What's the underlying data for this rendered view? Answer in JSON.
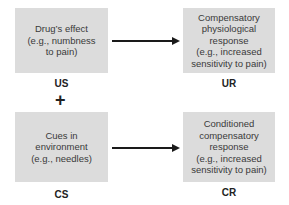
{
  "diagram": {
    "type": "classical-conditioning-drug-tolerance",
    "nodes": {
      "us": {
        "text": "Drug’s effect\n(e.g., numbness\nto pain)",
        "label": "US"
      },
      "ur": {
        "text": "Compensatory\nphysiological\nresponse\n(e.g., increased\nsensitivity to pain)",
        "label": "UR"
      },
      "cs": {
        "text": "Cues in\nenvironment\n(e.g., needles)",
        "label": "CS"
      },
      "cr": {
        "text": "Conditioned\ncompensatory\nresponse\n(e.g., increased\nsensitivity to pain)",
        "label": "CR"
      }
    },
    "connector": "+",
    "edges": [
      {
        "from": "us",
        "to": "ur"
      },
      {
        "from": "cs",
        "to": "cr"
      }
    ],
    "colors": {
      "box_fill": "#dcdcdc",
      "arrow": "#1a1a1a"
    }
  }
}
